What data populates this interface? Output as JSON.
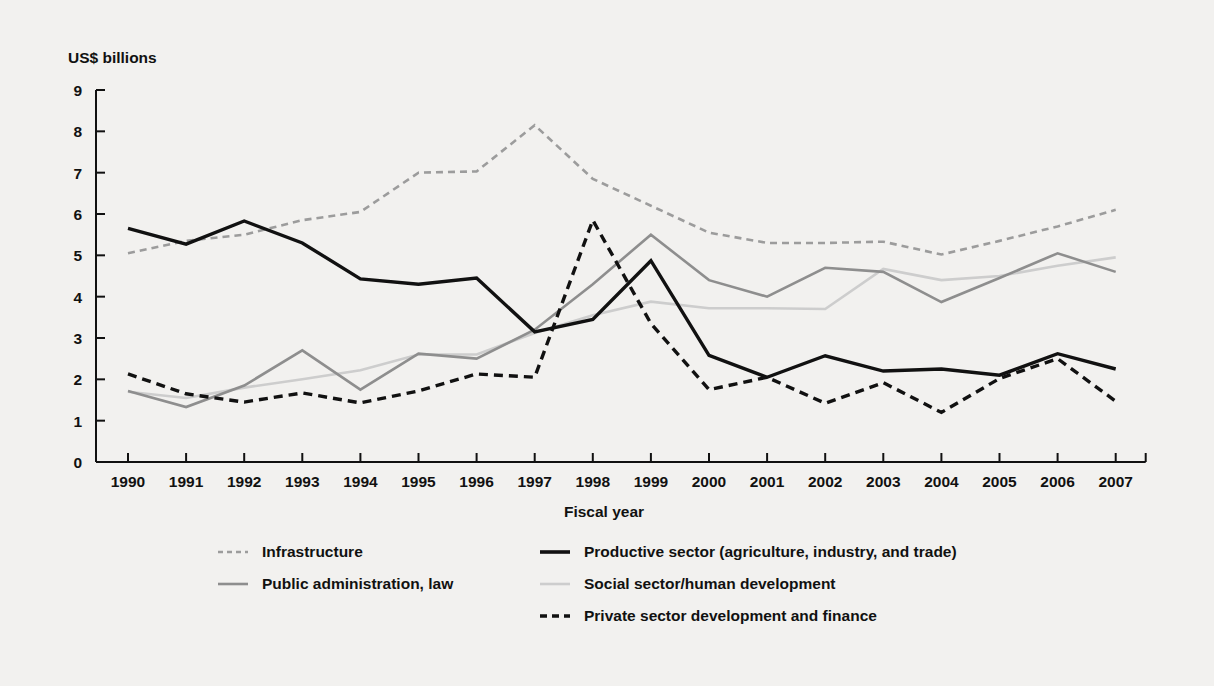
{
  "figure": {
    "y_axis_title": "US$ billions",
    "x_axis_title": "Fiscal year",
    "background_color": "#f2f1ef"
  },
  "chart_data": {
    "type": "line",
    "title": "",
    "subtitle": "",
    "xlabel": "Fiscal year",
    "ylabel": "US$ billions",
    "xlim": [
      1990,
      2007
    ],
    "ylim": [
      0,
      9
    ],
    "ytick_labels": [
      "0",
      "1",
      "2",
      "3",
      "4",
      "5",
      "6",
      "7",
      "8",
      "9"
    ],
    "yticks": [
      0,
      1,
      2,
      3,
      4,
      5,
      6,
      7,
      8,
      9
    ],
    "grid": false,
    "legend_position": "bottom",
    "categories": [
      1990,
      1991,
      1992,
      1993,
      1994,
      1995,
      1996,
      1997,
      1998,
      1999,
      2000,
      2001,
      2002,
      2003,
      2004,
      2005,
      2006,
      2007
    ],
    "xtick_labels": [
      "1990",
      "1991",
      "1992",
      "1993",
      "1994",
      "1995",
      "1996",
      "1997",
      "1998",
      "1999",
      "2000",
      "2001",
      "2002",
      "2003",
      "2004",
      "2005",
      "2006",
      "2007"
    ],
    "series": [
      {
        "name": "Infrastructure",
        "color": "#9c9c9c",
        "style": "dashed",
        "width": 2.6,
        "dash": "7,5",
        "values": [
          5.05,
          5.35,
          5.5,
          5.85,
          6.05,
          7.0,
          7.03,
          8.15,
          6.85,
          6.2,
          5.55,
          5.3,
          5.3,
          5.33,
          5.02,
          5.35,
          5.7,
          6.1
        ]
      },
      {
        "name": "Productive sector (agriculture, industry, and trade)",
        "color": "#111111",
        "style": "solid",
        "width": 3.4,
        "dash": "",
        "values": [
          5.65,
          5.27,
          5.83,
          5.3,
          4.43,
          4.3,
          4.45,
          3.15,
          3.45,
          4.87,
          2.58,
          2.05,
          2.57,
          2.2,
          2.25,
          2.1,
          2.62,
          2.25
        ]
      },
      {
        "name": "Public administration, law",
        "color": "#8e8e8e",
        "style": "solid",
        "width": 2.6,
        "dash": "",
        "values": [
          1.72,
          1.33,
          1.85,
          2.7,
          1.75,
          2.62,
          2.5,
          3.2,
          4.3,
          5.5,
          4.4,
          4.0,
          4.7,
          4.6,
          3.87,
          4.45,
          5.05,
          4.6
        ]
      },
      {
        "name": "Social sector/human development",
        "color": "#cdcdcd",
        "style": "solid",
        "width": 2.6,
        "dash": "",
        "values": [
          1.7,
          1.55,
          1.8,
          2.0,
          2.22,
          2.6,
          2.6,
          3.12,
          3.55,
          3.88,
          3.72,
          3.72,
          3.7,
          4.67,
          4.4,
          4.5,
          4.75,
          4.95
        ]
      },
      {
        "name": "Private sector development and finance",
        "color": "#111111",
        "style": "dashed",
        "width": 3.4,
        "dash": "9,6",
        "values": [
          2.13,
          1.65,
          1.45,
          1.67,
          1.43,
          1.72,
          2.13,
          2.05,
          5.85,
          3.35,
          1.75,
          2.05,
          1.42,
          1.92,
          1.2,
          2.02,
          2.5,
          1.47
        ]
      }
    ]
  },
  "legend": {
    "entries": [
      {
        "label": "Infrastructure",
        "color": "#9c9c9c",
        "style": "dashed",
        "width": 2.6,
        "dash": "5,4"
      },
      {
        "label": "Productive sector (agriculture, industry, and trade)",
        "color": "#111111",
        "style": "solid",
        "width": 3.6,
        "dash": ""
      },
      {
        "label": "Public administration, law",
        "color": "#8e8e8e",
        "style": "solid",
        "width": 2.6,
        "dash": ""
      },
      {
        "label": "Social sector/human development",
        "color": "#cdcdcd",
        "style": "solid",
        "width": 2.6,
        "dash": ""
      },
      {
        "label": "Private sector development and finance",
        "color": "#111111",
        "style": "dashed",
        "width": 3.6,
        "dash": "7,5"
      }
    ]
  }
}
